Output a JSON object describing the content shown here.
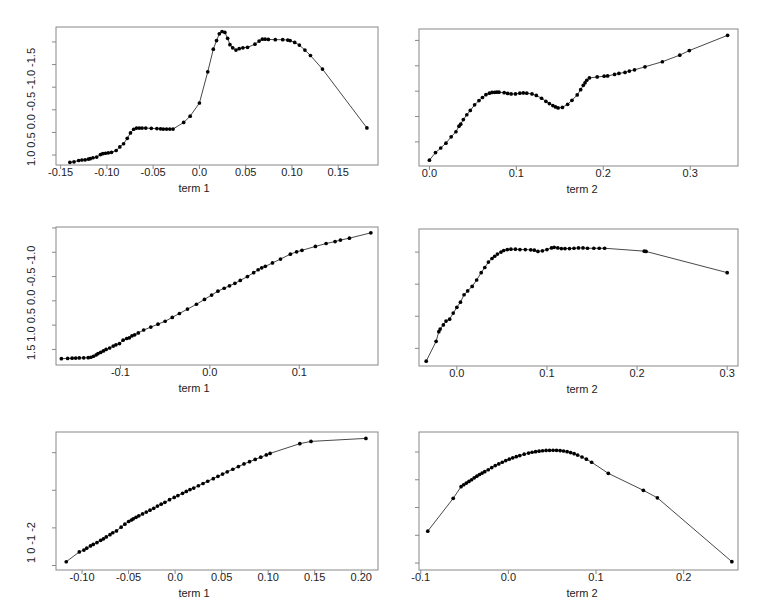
{
  "figure": {
    "type": "multi-panel-scatter-line",
    "rows": 3,
    "cols": 2,
    "background": "#ffffff",
    "line_color": "#333333",
    "point_color": "#000000",
    "frame_color": "#888888"
  },
  "chart_data": [
    {
      "id": "panel-r1c1",
      "type": "line",
      "title": "",
      "xlabel": "term 1",
      "ylabel": "",
      "xlim": [
        -0.155,
        0.193
      ],
      "ylim": [
        -1.72,
        1.33
      ],
      "xticks": [
        -0.15,
        -0.1,
        -0.05,
        0.0,
        0.05,
        0.1,
        0.15
      ],
      "xticklabels": [
        "-0.15",
        "-0.10",
        "-0.05",
        "0.0",
        "0.05",
        "0.10",
        "0.15"
      ],
      "yticks": [
        -1.5,
        -1.0,
        -0.5,
        0.0,
        0.5,
        1.0
      ],
      "yticklabels": [
        "-1.5",
        "-1.0",
        "-0.5",
        "0.0",
        "0.5",
        "1.0"
      ],
      "grid": false,
      "legend": null,
      "markers": true,
      "x": [
        -0.14,
        -0.1355,
        -0.1305,
        -0.127,
        -0.1235,
        -0.12,
        -0.118,
        -0.115,
        -0.111,
        -0.107,
        -0.1045,
        -0.1015,
        -0.0985,
        -0.095,
        -0.09,
        -0.086,
        -0.082,
        -0.078,
        -0.0745,
        -0.071,
        -0.068,
        -0.065,
        -0.062,
        -0.058,
        -0.052,
        -0.046,
        -0.042,
        -0.039,
        -0.0355,
        -0.032,
        -0.0285,
        -0.017,
        -0.01,
        0.0,
        0.009,
        0.015,
        0.0185,
        0.0215,
        0.0245,
        0.0275,
        0.0305,
        0.033,
        0.036,
        0.0395,
        0.043,
        0.047,
        0.052,
        0.06,
        0.0645,
        0.068,
        0.071,
        0.0745,
        0.082,
        0.09,
        0.0955,
        0.098,
        0.103,
        0.108,
        0.114,
        0.12,
        0.133,
        0.181
      ],
      "y": [
        -1.66,
        -1.65,
        -1.62,
        -1.61,
        -1.605,
        -1.59,
        -1.58,
        -1.56,
        -1.545,
        -1.49,
        -1.47,
        -1.46,
        -1.45,
        -1.44,
        -1.4,
        -1.32,
        -1.25,
        -1.13,
        -1.01,
        -0.93,
        -0.905,
        -0.905,
        -0.905,
        -0.905,
        -0.91,
        -0.915,
        -0.92,
        -0.925,
        -0.925,
        -0.925,
        -0.925,
        -0.78,
        -0.64,
        -0.35,
        0.34,
        0.84,
        1.03,
        1.18,
        1.23,
        1.21,
        1.08,
        0.94,
        0.87,
        0.82,
        0.85,
        0.87,
        0.88,
        0.95,
        1.02,
        1.06,
        1.06,
        1.055,
        1.05,
        1.05,
        1.04,
        1.03,
        0.99,
        0.93,
        0.82,
        0.7,
        0.4,
        -0.9
      ]
    },
    {
      "id": "panel-r1c2",
      "type": "line",
      "title": "",
      "xlabel": "term 2",
      "ylabel": "",
      "xlim": [
        -0.012,
        0.355
      ],
      "ylim": [
        -2.95,
        2.45
      ],
      "xticks": [
        0.0,
        0.1,
        0.2,
        0.3
      ],
      "xticklabels": [
        "0.0",
        "0.1",
        "0.2",
        "0.3"
      ],
      "yticks": [
        -2,
        -1,
        0,
        1,
        2
      ],
      "yticklabels": [
        "-2",
        "-1",
        "0",
        "1",
        "2"
      ],
      "grid": false,
      "legend": null,
      "markers": true,
      "x": [
        0.0,
        0.007,
        0.013,
        0.019,
        0.025,
        0.0305,
        0.034,
        0.036,
        0.039,
        0.043,
        0.047,
        0.052,
        0.057,
        0.061,
        0.065,
        0.069,
        0.072,
        0.075,
        0.0775,
        0.08,
        0.086,
        0.09,
        0.094,
        0.099,
        0.104,
        0.108,
        0.112,
        0.118,
        0.123,
        0.129,
        0.134,
        0.138,
        0.142,
        0.145,
        0.148,
        0.153,
        0.159,
        0.164,
        0.17,
        0.174,
        0.177,
        0.179,
        0.181,
        0.184,
        0.193,
        0.201,
        0.205,
        0.213,
        0.218,
        0.225,
        0.23,
        0.236,
        0.248,
        0.268,
        0.288,
        0.299,
        0.343
      ],
      "y": [
        -2.72,
        -2.42,
        -2.24,
        -2.05,
        -1.8,
        -1.6,
        -1.38,
        -1.3,
        -1.12,
        -0.93,
        -0.76,
        -0.54,
        -0.37,
        -0.25,
        -0.14,
        -0.08,
        -0.05,
        -0.045,
        -0.04,
        -0.04,
        -0.06,
        -0.09,
        -0.11,
        -0.11,
        -0.08,
        -0.07,
        -0.08,
        -0.11,
        -0.17,
        -0.28,
        -0.4,
        -0.49,
        -0.57,
        -0.62,
        -0.66,
        -0.64,
        -0.52,
        -0.36,
        -0.15,
        0.06,
        0.23,
        0.33,
        0.43,
        0.52,
        0.56,
        0.59,
        0.6,
        0.66,
        0.7,
        0.74,
        0.79,
        0.84,
        0.96,
        1.16,
        1.42,
        1.6,
        2.2
      ]
    },
    {
      "id": "panel-r2c1",
      "type": "line",
      "title": "",
      "xlabel": "term 1",
      "ylabel": "",
      "xlim": [
        -0.172,
        0.188
      ],
      "ylim": [
        -1.32,
        1.52
      ],
      "xticks": [
        -0.1,
        0.0,
        0.1
      ],
      "xticklabels": [
        "-0.1",
        "0.0",
        "0.1"
      ],
      "yticks": [
        -1.0,
        -0.5,
        0.0,
        0.5,
        1.0,
        1.5
      ],
      "yticklabels": [
        "-1.0",
        "-0.5",
        "0.0",
        "0.5",
        "1.0",
        "1.5"
      ],
      "grid": false,
      "legend": null,
      "markers": true,
      "x": [
        -0.166,
        -0.159,
        -0.154,
        -0.15,
        -0.146,
        -0.141,
        -0.136,
        -0.133,
        -0.13,
        -0.127,
        -0.125,
        -0.122,
        -0.119,
        -0.116,
        -0.112,
        -0.108,
        -0.105,
        -0.101,
        -0.097,
        -0.093,
        -0.09,
        -0.087,
        -0.084,
        -0.08,
        -0.074,
        -0.066,
        -0.058,
        -0.05,
        -0.042,
        -0.034,
        -0.025,
        -0.015,
        -0.006,
        0.002,
        0.009,
        0.016,
        0.022,
        0.028,
        0.034,
        0.042,
        0.049,
        0.054,
        0.058,
        0.062,
        0.07,
        0.079,
        0.09,
        0.097,
        0.103,
        0.118,
        0.13,
        0.14,
        0.146,
        0.156,
        0.18
      ],
      "y": [
        -1.19,
        -1.185,
        -1.18,
        -1.178,
        -1.175,
        -1.173,
        -1.17,
        -1.16,
        -1.14,
        -1.11,
        -1.085,
        -1.06,
        -1.03,
        -1.0,
        -0.97,
        -0.93,
        -0.905,
        -0.88,
        -0.81,
        -0.775,
        -0.76,
        -0.72,
        -0.7,
        -0.66,
        -0.6,
        -0.54,
        -0.48,
        -0.42,
        -0.34,
        -0.26,
        -0.17,
        -0.07,
        0.03,
        0.12,
        0.2,
        0.26,
        0.31,
        0.36,
        0.42,
        0.5,
        0.58,
        0.64,
        0.68,
        0.71,
        0.78,
        0.86,
        0.96,
        1.01,
        1.04,
        1.12,
        1.18,
        1.22,
        1.25,
        1.29,
        1.4
      ]
    },
    {
      "id": "panel-r2c2",
      "type": "line",
      "title": "",
      "xlabel": "term 2",
      "ylabel": "",
      "xlim": [
        -0.042,
        0.312
      ],
      "ylim": [
        -3.55,
        0.72
      ],
      "xticks": [
        0.0,
        0.1,
        0.2,
        0.3
      ],
      "xticklabels": [
        "0.0",
        "0.1",
        "0.2",
        "0.3"
      ],
      "yticks": [
        -3,
        -2,
        -1,
        0
      ],
      "yticklabels": [
        "-3",
        "-2",
        "-1",
        "0"
      ],
      "grid": false,
      "legend": null,
      "markers": true,
      "x": [
        -0.034,
        -0.023,
        -0.02,
        -0.0185,
        -0.015,
        -0.012,
        -0.008,
        -0.004,
        0.0,
        0.004,
        0.008,
        0.012,
        0.017,
        0.022,
        0.027,
        0.031,
        0.035,
        0.039,
        0.042,
        0.045,
        0.049,
        0.052,
        0.056,
        0.06,
        0.065,
        0.07,
        0.076,
        0.082,
        0.086,
        0.09,
        0.095,
        0.1,
        0.105,
        0.108,
        0.112,
        0.116,
        0.12,
        0.125,
        0.13,
        0.135,
        0.14,
        0.145,
        0.152,
        0.158,
        0.164,
        0.208,
        0.21,
        0.3
      ],
      "y": [
        -3.4,
        -2.78,
        -2.48,
        -2.4,
        -2.27,
        -2.15,
        -2.09,
        -1.9,
        -1.72,
        -1.56,
        -1.33,
        -1.21,
        -1.07,
        -0.87,
        -0.64,
        -0.48,
        -0.31,
        -0.2,
        -0.13,
        -0.06,
        0.0,
        0.05,
        0.08,
        0.09,
        0.09,
        0.08,
        0.08,
        0.07,
        0.06,
        0.02,
        0.04,
        0.08,
        0.13,
        0.15,
        0.13,
        0.11,
        0.11,
        0.11,
        0.12,
        0.13,
        0.13,
        0.12,
        0.12,
        0.12,
        0.12,
        0.03,
        0.02,
        -0.64
      ]
    },
    {
      "id": "panel-r3c1",
      "type": "line",
      "title": "",
      "xlabel": "term 1",
      "ylabel": "",
      "xlim": [
        -0.128,
        0.218
      ],
      "ylim": [
        -2.12,
        1.55
      ],
      "xticks": [
        -0.1,
        -0.05,
        0.0,
        0.05,
        0.1,
        0.15,
        0.2
      ],
      "xticklabels": [
        "-0.10",
        "-0.05",
        "0.0",
        "0.05",
        "0.10",
        "0.15",
        "0.20"
      ],
      "yticks": [
        -2,
        -1,
        0,
        1
      ],
      "yticklabels": [
        "-2",
        "-1",
        "0",
        "1"
      ],
      "grid": false,
      "legend": null,
      "markers": true,
      "x": [
        -0.117,
        -0.103,
        -0.098,
        -0.095,
        -0.091,
        -0.088,
        -0.084,
        -0.08,
        -0.077,
        -0.074,
        -0.07,
        -0.067,
        -0.063,
        -0.058,
        -0.054,
        -0.05,
        -0.047,
        -0.045,
        -0.042,
        -0.039,
        -0.035,
        -0.031,
        -0.027,
        -0.023,
        -0.019,
        -0.015,
        -0.011,
        -0.006,
        -0.001,
        0.003,
        0.008,
        0.012,
        0.016,
        0.02,
        0.025,
        0.03,
        0.035,
        0.041,
        0.046,
        0.051,
        0.056,
        0.062,
        0.068,
        0.074,
        0.08,
        0.086,
        0.092,
        0.098,
        0.102,
        0.134,
        0.146,
        0.205
      ],
      "y": [
        -1.9,
        -1.64,
        -1.59,
        -1.54,
        -1.48,
        -1.44,
        -1.39,
        -1.33,
        -1.29,
        -1.24,
        -1.18,
        -1.13,
        -1.08,
        -0.98,
        -0.9,
        -0.83,
        -0.79,
        -0.76,
        -0.72,
        -0.68,
        -0.63,
        -0.58,
        -0.53,
        -0.48,
        -0.42,
        -0.37,
        -0.32,
        -0.25,
        -0.19,
        -0.14,
        -0.08,
        -0.03,
        0.02,
        0.06,
        0.12,
        0.18,
        0.24,
        0.31,
        0.37,
        0.43,
        0.49,
        0.56,
        0.63,
        0.7,
        0.76,
        0.82,
        0.88,
        0.94,
        0.98,
        1.24,
        1.3,
        1.38
      ]
    },
    {
      "id": "panel-r3c2",
      "type": "line",
      "title": "",
      "xlabel": "term 2",
      "ylabel": "",
      "xlim": [
        -0.102,
        0.262
      ],
      "ylim": [
        -4.25,
        0.72
      ],
      "xticks": [
        -0.1,
        0.0,
        0.1,
        0.2
      ],
      "xticklabels": [
        "-0.1",
        "0.0",
        "0.1",
        "0.2"
      ],
      "yticks": [
        -4,
        -3,
        -2,
        -1,
        0
      ],
      "yticklabels": [
        "-4",
        "-3",
        "-2",
        "-1",
        "0"
      ],
      "grid": false,
      "legend": null,
      "markers": true,
      "x": [
        -0.092,
        -0.063,
        -0.054,
        -0.051,
        -0.048,
        -0.045,
        -0.042,
        -0.039,
        -0.036,
        -0.033,
        -0.03,
        -0.027,
        -0.023,
        -0.019,
        -0.015,
        -0.011,
        -0.007,
        -0.003,
        0.001,
        0.005,
        0.009,
        0.013,
        0.018,
        0.023,
        0.027,
        0.031,
        0.035,
        0.039,
        0.043,
        0.047,
        0.051,
        0.055,
        0.059,
        0.063,
        0.067,
        0.071,
        0.075,
        0.079,
        0.084,
        0.089,
        0.095,
        0.114,
        0.154,
        0.17,
        0.255
      ],
      "y": [
        -2.85,
        -1.67,
        -1.25,
        -1.18,
        -1.12,
        -1.06,
        -1.0,
        -0.93,
        -0.87,
        -0.81,
        -0.76,
        -0.71,
        -0.64,
        -0.56,
        -0.49,
        -0.43,
        -0.37,
        -0.31,
        -0.26,
        -0.21,
        -0.17,
        -0.13,
        -0.08,
        -0.04,
        -0.01,
        0.01,
        0.03,
        0.045,
        0.055,
        0.06,
        0.062,
        0.06,
        0.05,
        0.035,
        0.01,
        -0.02,
        -0.06,
        -0.11,
        -0.18,
        -0.26,
        -0.37,
        -0.77,
        -1.38,
        -1.65,
        -3.95
      ]
    }
  ]
}
